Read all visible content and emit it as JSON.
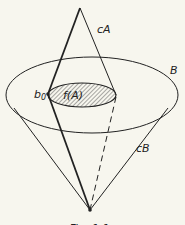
{
  "diagram": {
    "labels": {
      "cA": "cA",
      "B": "B",
      "fA": "f(A)",
      "b0": "b",
      "b0_sub": "0",
      "cB": "cB"
    },
    "caption": "Fig. 1.1",
    "colors": {
      "line": "#222222",
      "background": "#f7f6ee",
      "hatch": "#555555"
    }
  }
}
